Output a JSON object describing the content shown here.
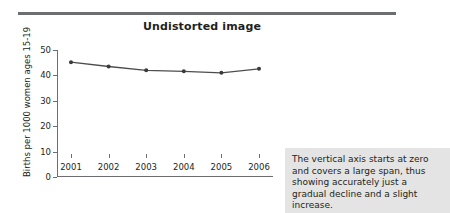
{
  "figure": {
    "title": "Undistorted image",
    "caption": "The vertical axis starts at zero and covers a large span, thus showing accurately just a gradual decline and a slight increase.",
    "rule_color": "#6d6e71",
    "caption_bg": "#e4e4e4",
    "line_color": "#4d4d4f",
    "marker_color": "#3a3a3c"
  },
  "chart_data": {
    "type": "line",
    "title": "Undistorted image",
    "xlabel": "",
    "ylabel": "Births per 1000 women ages 15-19",
    "categories": [
      "2001",
      "2002",
      "2003",
      "2004",
      "2005",
      "2006"
    ],
    "values": [
      45.2,
      43.5,
      42.0,
      41.6,
      41.0,
      42.6
    ],
    "series": [
      {
        "name": "Births per 1000 women ages 15-19",
        "values": [
          45.2,
          43.5,
          42.0,
          41.6,
          41.0,
          42.6
        ]
      }
    ],
    "ylim": [
      0,
      50
    ],
    "yticks": [
      0,
      10,
      20,
      30,
      40,
      50
    ],
    "ytick_labels": [
      "0",
      "10",
      "20",
      "30",
      "40",
      "50"
    ],
    "xtick_labels": [
      "2001",
      "2002",
      "2003",
      "2004",
      "2005",
      "2006"
    ],
    "grid": false,
    "legend": false,
    "legend_position": "none",
    "markers": "filled-circle"
  }
}
